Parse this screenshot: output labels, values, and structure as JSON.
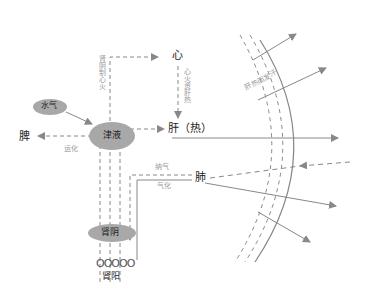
{
  "nodes": {
    "heart": "心",
    "liver": "肝（热）",
    "spleen": "脾",
    "lung": "肺",
    "fluids": "津液",
    "water_qi": "水气",
    "kidney_yin": "肾阴",
    "kidney_yang": "肾阳",
    "kidney_yang_circles": "OOOOO"
  },
  "edge_labels": {
    "kidney_yin_controls_heart_fire": "肾阴制心火",
    "heart_fire_aids_liver_heat": "心火资肝热",
    "transport": "运化",
    "receive_qi": "纳气",
    "qi_transform": "气化",
    "liver_heat_sweat": "肝热而发汗"
  },
  "colors": {
    "line": "#888888",
    "ellipse_fill": "#a8a8a8",
    "text": "#222222",
    "label": "#999999"
  }
}
